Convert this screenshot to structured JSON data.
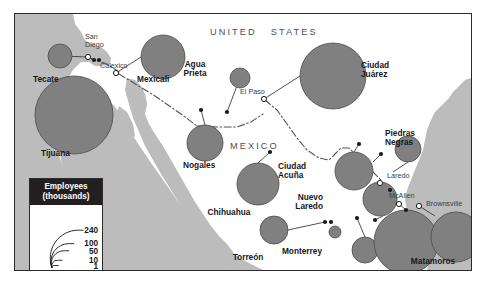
{
  "map": {
    "title_regions": [
      {
        "name": "united-states",
        "text": "UNITED   STATES",
        "x": 195,
        "y": 14
      },
      {
        "name": "mexico",
        "text": "MEXICO",
        "x": 215,
        "y": 128
      }
    ],
    "colors": {
      "circle_fill": "#808080",
      "circle_stroke": "#4a4a4a",
      "land": "#bcbcbc",
      "water": "#ffffff",
      "border_line": "#555555",
      "frame": "#2b2b2b",
      "legend_header_bg": "#231f20",
      "text": "#15171a"
    },
    "legend": {
      "title_line1": "Employees",
      "title_line2": "(thousands)",
      "ticks": [
        {
          "label": "240",
          "value": 240
        },
        {
          "label": "100",
          "value": 100
        },
        {
          "label": "50",
          "value": 50
        },
        {
          "label": "10",
          "value": 10
        },
        {
          "label": "1",
          "value": 1
        }
      ]
    },
    "maquila_cities": [
      {
        "name": "Tecate",
        "label_x": 18,
        "label_y": 61,
        "label_align": "left",
        "cx": 45,
        "cy": 42,
        "r": 12
      },
      {
        "name": "Tijuana",
        "label_x": 26,
        "label_y": 135,
        "label_align": "left",
        "cx": 59,
        "cy": 101,
        "r": 39
      },
      {
        "name": "Mexicali",
        "label_x": 122,
        "label_y": 61,
        "label_align": "left",
        "cx": 148,
        "cy": 43,
        "r": 22
      },
      {
        "name": "Agua Prieta",
        "label_x": 180,
        "label_y": 46,
        "label_align": "center",
        "cx": 225,
        "cy": 64,
        "r": 10
      },
      {
        "name": "Nogales",
        "label_x": 168,
        "label_y": 147,
        "label_align": "left",
        "cx": 190,
        "cy": 129,
        "r": 18
      },
      {
        "name": "Ciudad Juárez",
        "label_x": 346,
        "label_y": 47,
        "label_align": "left",
        "cx": 318,
        "cy": 62,
        "r": 33
      },
      {
        "name": "Piedras Negras",
        "label_x": 370,
        "label_y": 115,
        "label_align": "left",
        "cx": 393,
        "cy": 135,
        "r": 13
      },
      {
        "name": "Chihuahua",
        "label_x": 214,
        "label_y": 194,
        "label_align": "center",
        "cx": 243,
        "cy": 170,
        "r": 21
      },
      {
        "name": "Ciudad Acuña",
        "label_x": 263,
        "label_y": 148,
        "label_align": "left",
        "cx": 339,
        "cy": 157,
        "r": 19
      },
      {
        "name": "Nuevo Laredo",
        "label_x": 308,
        "label_y": 179,
        "label_align": "right",
        "cx": 365,
        "cy": 185,
        "r": 17
      },
      {
        "name": "Torreón",
        "label_x": 233,
        "label_y": 239,
        "label_align": "center",
        "cx": 259,
        "cy": 216,
        "r": 14
      },
      {
        "name": "Monterrey",
        "label_x": 287,
        "label_y": 233,
        "label_align": "center",
        "cx": 320,
        "cy": 218,
        "r": 6
      },
      {
        "name": "Guadalupe",
        "label_x": 307,
        "label_y": 260,
        "label_align": "center",
        "cx": 350,
        "cy": 236,
        "r": 13
      },
      {
        "name": "Reynosa",
        "label_x": 370,
        "label_y": 261,
        "label_align": "center",
        "cx": 391,
        "cy": 228,
        "r": 32
      },
      {
        "name": "Matamoros",
        "label_x": 418,
        "label_y": 243,
        "label_align": "center",
        "cx": 441,
        "cy": 223,
        "r": 25
      }
    ],
    "us_cities": [
      {
        "name": "San Diego",
        "line1": "San",
        "line2": "Diego",
        "label_x": 70,
        "label_y": 19,
        "mx": 73,
        "my": 43
      },
      {
        "name": "Calexico",
        "line1": "Calexico",
        "line2": "",
        "label_x": 85,
        "label_y": 48,
        "mx": 101,
        "my": 59
      },
      {
        "name": "El Paso",
        "line1": "El Paso",
        "line2": "",
        "label_x": 225,
        "label_y": 74,
        "mx": 249,
        "my": 85
      },
      {
        "name": "Laredo",
        "line1": "Laredo",
        "line2": "",
        "label_x": 372,
        "label_y": 158,
        "mx": 365,
        "my": 169
      },
      {
        "name": "McAllen",
        "line1": "McAllen",
        "line2": "",
        "label_x": 374,
        "label_y": 178,
        "mx": 384,
        "my": 190
      },
      {
        "name": "Brownsville",
        "line1": "Brownsville",
        "line2": "",
        "label_x": 411,
        "label_y": 186,
        "mx": 404,
        "my": 192
      }
    ]
  }
}
